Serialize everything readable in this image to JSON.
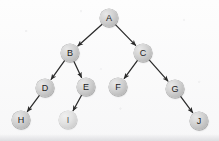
{
  "figure": {
    "kind": "binary-tree-diagram",
    "title": "",
    "width": 219,
    "height": 141,
    "background_color": "#fbfbfb",
    "node_fill_color": "#cfcfcf",
    "node_stroke_color": "#808080",
    "edge_color": "#2b2b2b",
    "label_color": "#1b1b1b"
  },
  "nodes": [
    {
      "id": "A",
      "label": "A",
      "cx": 109,
      "cy": 18,
      "r": 9.0,
      "style": "normal"
    },
    {
      "id": "B",
      "label": "B",
      "cx": 70,
      "cy": 53,
      "r": 9.0,
      "style": "normal"
    },
    {
      "id": "C",
      "label": "C",
      "cx": 143,
      "cy": 53,
      "r": 9.0,
      "style": "normal"
    },
    {
      "id": "D",
      "label": "D",
      "cx": 45,
      "cy": 88,
      "r": 9.0,
      "style": "normal"
    },
    {
      "id": "E",
      "label": "E",
      "cx": 86,
      "cy": 87,
      "r": 9.0,
      "style": "normal"
    },
    {
      "id": "F",
      "label": "F",
      "cx": 118,
      "cy": 87,
      "r": 9.0,
      "style": "normal"
    },
    {
      "id": "G",
      "label": "G",
      "cx": 175,
      "cy": 89,
      "r": 9.0,
      "style": "normal"
    },
    {
      "id": "H",
      "label": "H",
      "cx": 21,
      "cy": 120,
      "r": 9.0,
      "style": "normal"
    },
    {
      "id": "I",
      "label": "I",
      "cx": 68,
      "cy": 120,
      "r": 9.0,
      "style": "faint"
    },
    {
      "id": "J",
      "label": "J",
      "cx": 199,
      "cy": 121,
      "r": 9.0,
      "style": "normal"
    }
  ],
  "edges": [
    {
      "from": "A",
      "to": "B",
      "directed": true
    },
    {
      "from": "A",
      "to": "C",
      "directed": true
    },
    {
      "from": "B",
      "to": "D",
      "directed": true
    },
    {
      "from": "B",
      "to": "E",
      "directed": true
    },
    {
      "from": "C",
      "to": "F",
      "directed": true
    },
    {
      "from": "C",
      "to": "G",
      "directed": true
    },
    {
      "from": "D",
      "to": "H",
      "directed": true
    },
    {
      "from": "E",
      "to": "I",
      "directed": true
    },
    {
      "from": "G",
      "to": "J",
      "directed": true
    }
  ]
}
